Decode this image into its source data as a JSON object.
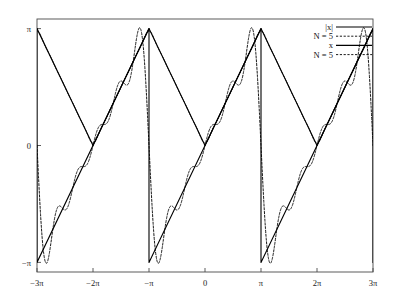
{
  "chart_data": {
    "type": "line",
    "title": "",
    "xlabel": "",
    "ylabel": "",
    "xlim": [
      -9.4247779608,
      9.4247779608
    ],
    "ylim": [
      -3.4,
      3.4
    ],
    "grid": false,
    "legend_position": "top-right",
    "xticks": [
      -9.4247779608,
      -6.2831853072,
      -3.1415926536,
      0,
      3.1415926536,
      6.2831853072,
      9.4247779608
    ],
    "xticklabels": [
      "−3π",
      "−2π",
      "−π",
      "0",
      "π",
      "2π",
      "3π"
    ],
    "yticks": [
      3.1415926536,
      0,
      -3.1415926536
    ],
    "yticklabels": [
      "π",
      "0",
      "−π"
    ],
    "series": [
      {
        "name": "|x|",
        "label": "|x|",
        "style": "solid",
        "color": "#000000",
        "linewidth": 1.1,
        "description": "Triangle wave: periodic extension of |x| on [-pi,pi], period 2pi. Peaks of value pi at odd multiples of pi, zeros at even multiples of pi.",
        "key_points": [
          [
            -9.4247779608,
            3.1415926536
          ],
          [
            -6.2831853072,
            0
          ],
          [
            -3.1415926536,
            3.1415926536
          ],
          [
            0,
            0
          ],
          [
            3.1415926536,
            3.1415926536
          ],
          [
            6.2831853072,
            0
          ],
          [
            9.4247779608,
            3.1415926536
          ]
        ]
      },
      {
        "name": "|x| N=5",
        "label": "N = 5",
        "style": "dashed",
        "color": "#000000",
        "linewidth": 0.9,
        "description": "Fourier cosine partial sum of |x| with N = 5 terms: pi/2 - (4/pi)*sum_{k odd,<=2N-1} cos(kx)/k^2. Smooth, tracks triangle wave with small ripple near the corners."
      },
      {
        "name": "x",
        "label": "x",
        "style": "solid",
        "color": "#000000",
        "linewidth": 1.1,
        "description": "Sawtooth wave: periodic extension of f(x)=x on (-pi,pi), period 2pi. Rises linearly from -pi to pi then jumps down.",
        "key_points": [
          [
            -9.4247779608,
            -3.1415926536
          ],
          [
            -6.2831853072,
            0
          ],
          [
            -3.1415926536,
            3.1415926536
          ],
          [
            -3.1415926536,
            -3.1415926536
          ],
          [
            0,
            0
          ],
          [
            3.1415926536,
            3.1415926536
          ],
          [
            3.1415926536,
            -3.1415926536
          ],
          [
            6.2831853072,
            0
          ],
          [
            9.4247779608,
            3.1415926536
          ]
        ]
      },
      {
        "name": "x N=5",
        "label": "N = 5",
        "style": "dashed",
        "color": "#000000",
        "linewidth": 0.9,
        "description": "Fourier sine partial sum of sawtooth with N = 5 terms: 2*sum_{k=1..5} (-1)^(k+1) sin(kx)/k. Shows Gibbs overshoot ripples at the jump discontinuities."
      }
    ]
  },
  "legend": {
    "entries": [
      {
        "label": "|x|",
        "style": "solid"
      },
      {
        "label": "N = 5",
        "style": "dashed"
      },
      {
        "label": "x",
        "style": "solid"
      },
      {
        "label": "N = 5",
        "style": "dashed"
      }
    ]
  },
  "axes": {
    "x_tick_labels": [
      "−3π",
      "−2π",
      "−π",
      "0",
      "π",
      "2π",
      "3π"
    ],
    "y_tick_labels": [
      "π",
      "0",
      "−π"
    ]
  },
  "colors": {
    "line": "#000000",
    "frame": "#4a4a4a",
    "background": "#ffffff",
    "text": "#111111"
  }
}
